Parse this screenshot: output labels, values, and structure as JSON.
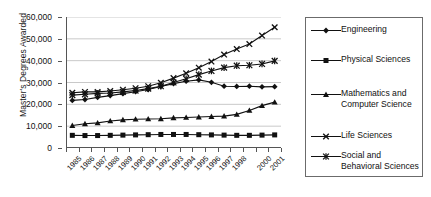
{
  "chart_data": {
    "type": "line",
    "title": "",
    "xlabel": "",
    "ylabel": "Master's Degrees Awarded",
    "ylim": [
      0,
      60000
    ],
    "ytick_values": [
      0,
      10000,
      20000,
      30000,
      40000,
      50000,
      60000
    ],
    "ytick_labels": [
      "0",
      "10,000",
      "20,000",
      "30,000",
      "40,000",
      "50,000",
      "60,000"
    ],
    "grid": "horizontal",
    "legend_position": "right",
    "categories": [
      "1985",
      "1986",
      "1987",
      "1988",
      "1989",
      "1990",
      "1991",
      "1992",
      "1993",
      "1994",
      "1995",
      "1996",
      "1997",
      "1998",
      "1999",
      "2000",
      "2001"
    ],
    "xtick_labels": [
      "1985",
      "1986",
      "1987",
      "1988",
      "1989",
      "1990",
      "1991",
      "1992",
      "1993",
      "1994",
      "1995",
      "1996",
      "1997",
      "1998",
      "",
      "2000",
      "2001"
    ],
    "series": [
      {
        "name": "Engineering",
        "marker": "diamond",
        "values": [
          21800,
          22200,
          23200,
          24000,
          24900,
          25800,
          26800,
          28200,
          29500,
          30600,
          31200,
          30100,
          28300,
          28200,
          28300,
          28000,
          28100
        ]
      },
      {
        "name": "Physical Sciences",
        "marker": "square",
        "values": [
          5800,
          5700,
          5700,
          5800,
          5900,
          6000,
          6100,
          6200,
          6200,
          6200,
          6100,
          6000,
          5900,
          5800,
          5800,
          5900,
          6000
        ]
      },
      {
        "name": "Mathematics and Computer Science",
        "marker": "triangle",
        "values": [
          10300,
          11100,
          11500,
          12400,
          12900,
          13200,
          13300,
          13400,
          13800,
          14000,
          14200,
          14400,
          14600,
          15400,
          17200,
          19400,
          21000
        ]
      },
      {
        "name": "Life Sciences",
        "marker": "x",
        "values": [
          25300,
          25700,
          25700,
          26100,
          26700,
          27400,
          28300,
          29900,
          32000,
          34200,
          36800,
          39600,
          42800,
          45300,
          47600,
          51500,
          55300
        ]
      },
      {
        "name": "Social and Behavioral Sciences",
        "marker": "asterisk",
        "values": [
          24200,
          24600,
          25000,
          25200,
          25700,
          26300,
          27200,
          28300,
          30000,
          31700,
          33600,
          35300,
          36800,
          37700,
          37900,
          38500,
          39900
        ]
      }
    ]
  },
  "legend": {
    "items": [
      {
        "label": "Engineering"
      },
      {
        "label": "Physical Sciences"
      },
      {
        "label": "Mathematics and Computer Science"
      },
      {
        "label": "Life Sciences"
      },
      {
        "label": "Social and Behavioral Sciences"
      }
    ]
  },
  "colors": {
    "line": "#111111",
    "axis": "#555555",
    "grid": "#c9c9c9",
    "text": "#111111"
  }
}
